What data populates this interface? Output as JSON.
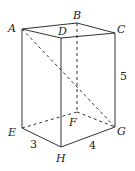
{
  "figure": {
    "type": "rectangular prism (cuboid)",
    "vertices": {
      "A": {
        "label": "A",
        "x": 22,
        "y": 29
      },
      "B": {
        "label": "B",
        "x": 77,
        "y": 23
      },
      "C": {
        "label": "C",
        "x": 115,
        "y": 33
      },
      "D": {
        "label": "D",
        "x": 61,
        "y": 38
      },
      "E": {
        "label": "E",
        "x": 22,
        "y": 128
      },
      "F": {
        "label": "F",
        "x": 77,
        "y": 112
      },
      "G": {
        "label": "G",
        "x": 115,
        "y": 127
      },
      "H": {
        "label": "H",
        "x": 61,
        "y": 147
      }
    },
    "dimensions": {
      "EH": "3",
      "HG": "4",
      "CG": "5"
    },
    "solid_edges": [
      "AB",
      "BC",
      "CD",
      "DA",
      "AE",
      "DH",
      "CG",
      "EH",
      "HG"
    ],
    "hidden_edges": [
      "BF",
      "EF",
      "FG"
    ],
    "diagonals": [
      "AG"
    ],
    "stroke_color": "#333333"
  }
}
